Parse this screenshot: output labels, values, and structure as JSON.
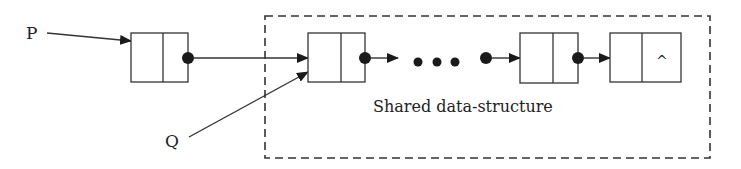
{
  "labels": {
    "p": "P",
    "q": "Q",
    "region": "Shared data-structure",
    "null_marker": "^",
    "ellipsis": "..."
  },
  "nodes": [
    {
      "id": "node-1",
      "x": 131,
      "y": 33,
      "w": 57,
      "h": 49,
      "divider": 163,
      "next": "pointer",
      "in_shared": false
    },
    {
      "id": "node-2",
      "x": 308,
      "y": 33,
      "w": 57,
      "h": 49,
      "divider": 341,
      "next": "pointer",
      "in_shared": true
    },
    {
      "id": "node-3",
      "x": 520,
      "y": 33,
      "w": 58,
      "h": 49,
      "divider": 553,
      "next": "pointer",
      "in_shared": true
    },
    {
      "id": "node-4",
      "x": 610,
      "y": 33,
      "w": 71,
      "h": 49,
      "divider": 642,
      "next": "null",
      "in_shared": true
    }
  ],
  "colors": {
    "stroke": "#333333",
    "fill": "#ffffff",
    "dot": "#1a1a1a"
  }
}
